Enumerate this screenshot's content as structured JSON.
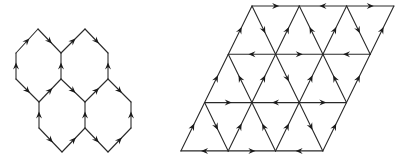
{
  "figure": {
    "width": 409,
    "height": 161,
    "stroke_color": "#2a2a2a",
    "arrow_color": "#1a1a1a",
    "panels": [
      {
        "id": "hexagonal-lattice",
        "description": "Honeycomb of four hexagons with oriented edges",
        "vertices": {
          "t1": [
            38,
            29
          ],
          "t2": [
            85,
            29
          ],
          "a0": [
            16,
            53
          ],
          "a1": [
            61,
            53
          ],
          "a2": [
            108,
            53
          ],
          "b0": [
            16,
            79
          ],
          "b1": [
            61,
            79
          ],
          "b2": [
            108,
            79
          ],
          "c0": [
            39,
            102
          ],
          "c1": [
            85,
            102
          ],
          "c2": [
            131,
            102
          ],
          "d0": [
            39,
            128
          ],
          "d1": [
            85,
            128
          ],
          "d2": [
            131,
            128
          ],
          "e0": [
            62,
            152
          ],
          "e1": [
            108,
            152
          ]
        },
        "edges": [
          [
            "a0",
            "t1"
          ],
          [
            "t1",
            "a1"
          ],
          [
            "a1",
            "t2"
          ],
          [
            "t2",
            "a2"
          ],
          [
            "b0",
            "a0"
          ],
          [
            "b1",
            "a1"
          ],
          [
            "b2",
            "a2"
          ],
          [
            "b0",
            "c0"
          ],
          [
            "c0",
            "b1"
          ],
          [
            "b1",
            "c1"
          ],
          [
            "c1",
            "b2"
          ],
          [
            "b2",
            "c2"
          ],
          [
            "d0",
            "c0"
          ],
          [
            "d1",
            "c1"
          ],
          [
            "d2",
            "c2"
          ],
          [
            "d0",
            "e0"
          ],
          [
            "e0",
            "d1"
          ],
          [
            "d1",
            "e1"
          ],
          [
            "e1",
            "d2"
          ]
        ]
      },
      {
        "id": "triangular-lattice",
        "description": "Rhombus-shaped triangular lattice (3x3 cells) with oriented edges",
        "origin": [
          252,
          6
        ],
        "col_step": [
          47.3,
          0
        ],
        "row_step": [
          -23.7,
          48.3
        ],
        "rows": 4,
        "cols": 4,
        "edges": [
          [
            [
              0,
              0
            ],
            [
              0,
              1
            ]
          ],
          [
            [
              0,
              2
            ],
            [
              0,
              1
            ]
          ],
          [
            [
              0,
              2
            ],
            [
              0,
              3
            ]
          ],
          [
            [
              1,
              0
            ],
            [
              0,
              0
            ]
          ],
          [
            [
              0,
              0
            ],
            [
              1,
              1
            ]
          ],
          [
            [
              1,
              1
            ],
            [
              0,
              1
            ]
          ],
          [
            [
              1,
              2
            ],
            [
              0,
              1
            ]
          ],
          [
            [
              1,
              2
            ],
            [
              0,
              2
            ]
          ],
          [
            [
              0,
              2
            ],
            [
              1,
              3
            ]
          ],
          [
            [
              1,
              3
            ],
            [
              0,
              3
            ]
          ],
          [
            [
              1,
              1
            ],
            [
              1,
              0
            ]
          ],
          [
            [
              1,
              1
            ],
            [
              1,
              2
            ]
          ],
          [
            [
              1,
              3
            ],
            [
              1,
              2
            ]
          ],
          [
            [
              2,
              0
            ],
            [
              1,
              0
            ]
          ],
          [
            [
              2,
              1
            ],
            [
              1,
              0
            ]
          ],
          [
            [
              2,
              1
            ],
            [
              1,
              1
            ]
          ],
          [
            [
              1,
              1
            ],
            [
              2,
              2
            ]
          ],
          [
            [
              2,
              2
            ],
            [
              1,
              2
            ]
          ],
          [
            [
              2,
              3
            ],
            [
              1,
              2
            ]
          ],
          [
            [
              2,
              3
            ],
            [
              1,
              3
            ]
          ],
          [
            [
              2,
              0
            ],
            [
              2,
              1
            ]
          ],
          [
            [
              2,
              2
            ],
            [
              2,
              1
            ]
          ],
          [
            [
              2,
              2
            ],
            [
              2,
              3
            ]
          ],
          [
            [
              3,
              0
            ],
            [
              2,
              0
            ]
          ],
          [
            [
              2,
              0
            ],
            [
              3,
              1
            ]
          ],
          [
            [
              3,
              1
            ],
            [
              2,
              1
            ]
          ],
          [
            [
              3,
              2
            ],
            [
              2,
              1
            ]
          ],
          [
            [
              3,
              2
            ],
            [
              2,
              2
            ]
          ],
          [
            [
              2,
              2
            ],
            [
              3,
              3
            ]
          ],
          [
            [
              3,
              3
            ],
            [
              2,
              3
            ]
          ],
          [
            [
              3,
              1
            ],
            [
              3,
              0
            ]
          ],
          [
            [
              3,
              1
            ],
            [
              3,
              2
            ]
          ],
          [
            [
              3,
              3
            ],
            [
              3,
              2
            ]
          ]
        ]
      }
    ]
  }
}
